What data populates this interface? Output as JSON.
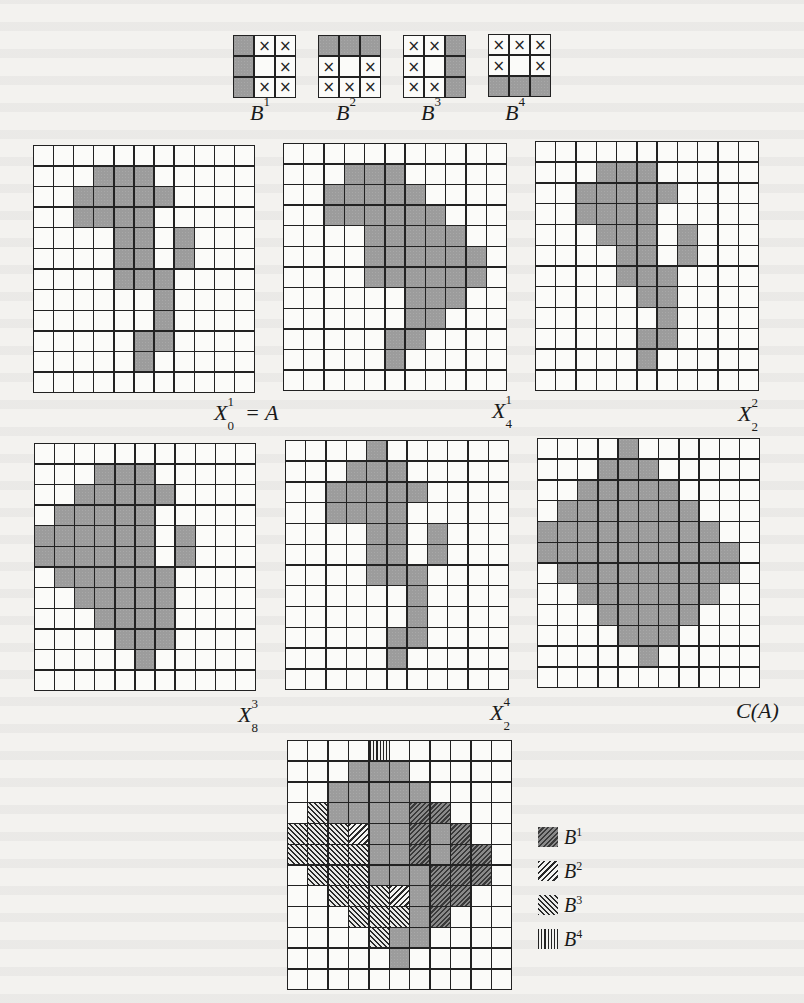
{
  "figure": {
    "grid_size": {
      "rows": 12,
      "cols": 11
    },
    "colors": {
      "shaded": "#9c9c9c",
      "line": "#222222",
      "background": "#f3f2ef"
    },
    "templates": [
      {
        "id": "B1",
        "base": "B",
        "sup": "1",
        "cells": [
          [
            "s",
            "x",
            "x"
          ],
          [
            "s",
            "o",
            "x"
          ],
          [
            "s",
            "x",
            "x"
          ]
        ]
      },
      {
        "id": "B2",
        "base": "B",
        "sup": "2",
        "cells": [
          [
            "s",
            "s",
            "s"
          ],
          [
            "x",
            "o",
            "x"
          ],
          [
            "x",
            "x",
            "x"
          ]
        ]
      },
      {
        "id": "B3",
        "base": "B",
        "sup": "3",
        "cells": [
          [
            "x",
            "x",
            "s"
          ],
          [
            "x",
            "o",
            "s"
          ],
          [
            "x",
            "x",
            "s"
          ]
        ]
      },
      {
        "id": "B4",
        "base": "B",
        "sup": "4",
        "cells": [
          [
            "x",
            "x",
            "x"
          ],
          [
            "x",
            "o",
            "x"
          ],
          [
            "s",
            "s",
            "s"
          ]
        ]
      }
    ],
    "panels": [
      {
        "id": "X01",
        "label_base": "X",
        "label_sup": "1",
        "label_sub": "0",
        "label_suffix": " = A",
        "shaded": {
          "1": [
            3,
            4,
            5
          ],
          "2": [
            2,
            3,
            4,
            5,
            6
          ],
          "3": [
            2,
            3,
            4,
            5
          ],
          "4": [
            4,
            5,
            7
          ],
          "5": [
            4,
            5,
            7
          ],
          "6": [
            4,
            5,
            6
          ],
          "7": [
            6
          ],
          "8": [
            6
          ],
          "9": [
            5,
            6
          ],
          "10": [
            5
          ]
        }
      },
      {
        "id": "X41",
        "label_base": "X",
        "label_sup": "1",
        "label_sub": "4",
        "label_suffix": "",
        "shaded": {
          "1": [
            3,
            4,
            5
          ],
          "2": [
            2,
            3,
            4,
            5,
            6
          ],
          "3": [
            2,
            3,
            4,
            5,
            6,
            7
          ],
          "4": [
            4,
            5,
            6,
            7,
            8
          ],
          "5": [
            4,
            5,
            6,
            7,
            8,
            9
          ],
          "6": [
            4,
            5,
            6,
            7,
            8,
            9
          ],
          "7": [
            6,
            7,
            8
          ],
          "8": [
            6,
            7
          ],
          "9": [
            5,
            6
          ],
          "10": [
            5
          ]
        }
      },
      {
        "id": "X22",
        "label_base": "X",
        "label_sup": "2",
        "label_sub": "2",
        "label_suffix": "",
        "shaded": {
          "1": [
            3,
            4,
            5
          ],
          "2": [
            2,
            3,
            4,
            5,
            6
          ],
          "3": [
            2,
            3,
            4,
            5
          ],
          "4": [
            3,
            4,
            5,
            7
          ],
          "5": [
            4,
            5,
            7
          ],
          "6": [
            4,
            5,
            6
          ],
          "7": [
            5,
            6
          ],
          "8": [
            6
          ],
          "9": [
            5,
            6
          ],
          "10": [
            5
          ]
        }
      },
      {
        "id": "X83",
        "label_base": "X",
        "label_sup": "3",
        "label_sub": "8",
        "label_suffix": "",
        "shaded": {
          "1": [
            3,
            4,
            5
          ],
          "2": [
            2,
            3,
            4,
            5,
            6
          ],
          "3": [
            1,
            2,
            3,
            4,
            5
          ],
          "4": [
            0,
            1,
            2,
            3,
            4,
            5,
            7
          ],
          "5": [
            0,
            1,
            2,
            3,
            4,
            5,
            7
          ],
          "6": [
            1,
            2,
            3,
            4,
            5,
            6
          ],
          "7": [
            2,
            3,
            4,
            5,
            6
          ],
          "8": [
            3,
            4,
            5,
            6
          ],
          "9": [
            4,
            5,
            6
          ],
          "10": [
            5
          ]
        }
      },
      {
        "id": "X24",
        "label_base": "X",
        "label_sup": "4",
        "label_sub": "2",
        "label_suffix": "",
        "shaded": {
          "0": [
            4
          ],
          "1": [
            3,
            4,
            5
          ],
          "2": [
            2,
            3,
            4,
            5,
            6
          ],
          "3": [
            2,
            3,
            4,
            5
          ],
          "4": [
            4,
            5,
            7
          ],
          "5": [
            4,
            5,
            7
          ],
          "6": [
            4,
            5,
            6
          ],
          "7": [
            6
          ],
          "8": [
            6
          ],
          "9": [
            5,
            6
          ],
          "10": [
            5
          ]
        }
      },
      {
        "id": "CA",
        "label_base": "C(A)",
        "label_sup": "",
        "label_sub": "",
        "label_suffix": "",
        "shaded": {
          "0": [
            4
          ],
          "1": [
            3,
            4,
            5
          ],
          "2": [
            2,
            3,
            4,
            5,
            6
          ],
          "3": [
            1,
            2,
            3,
            4,
            5,
            6,
            7
          ],
          "4": [
            0,
            1,
            2,
            3,
            4,
            5,
            6,
            7,
            8
          ],
          "5": [
            0,
            1,
            2,
            3,
            4,
            5,
            6,
            7,
            8,
            9
          ],
          "6": [
            1,
            2,
            3,
            4,
            5,
            6,
            7,
            8,
            9
          ],
          "7": [
            2,
            3,
            4,
            5,
            6,
            7,
            8
          ],
          "8": [
            3,
            4,
            5,
            6,
            7
          ],
          "9": [
            4,
            5,
            6
          ],
          "10": [
            5
          ]
        }
      }
    ],
    "combined": {
      "cells": {
        "0": {
          "4": "b4"
        },
        "1": {
          "3": "s",
          "4": "s",
          "5": "s"
        },
        "2": {
          "2": "s",
          "3": "s",
          "4": "s",
          "5": "s",
          "6": "s"
        },
        "3": {
          "1": "b3",
          "2": "s",
          "3": "s",
          "4": "s",
          "5": "s",
          "6": "b1",
          "7": "b1"
        },
        "4": {
          "0": "b3",
          "1": "b3",
          "2": "b3",
          "3": "b2",
          "4": "s",
          "5": "s",
          "6": "b1",
          "7": "s",
          "8": "b1"
        },
        "5": {
          "0": "b3",
          "1": "b3",
          "2": "b3",
          "3": "b3",
          "4": "s",
          "5": "s",
          "6": "b1",
          "7": "s",
          "8": "b1",
          "9": "b1"
        },
        "6": {
          "1": "b3",
          "2": "b3",
          "3": "b3",
          "4": "s",
          "5": "s",
          "6": "s",
          "7": "b1",
          "8": "b1",
          "9": "b1"
        },
        "7": {
          "2": "b3",
          "3": "b3",
          "4": "b3",
          "5": "b2",
          "6": "s",
          "7": "b1",
          "8": "b1"
        },
        "8": {
          "3": "b3",
          "4": "b3",
          "5": "b3",
          "6": "s",
          "7": "b1"
        },
        "9": {
          "4": "b3",
          "5": "s",
          "6": "s"
        },
        "10": {
          "5": "s"
        }
      },
      "legend": [
        {
          "pattern": "b1",
          "base": "B",
          "sup": "1"
        },
        {
          "pattern": "b2",
          "base": "B",
          "sup": "2"
        },
        {
          "pattern": "b3",
          "base": "B",
          "sup": "3"
        },
        {
          "pattern": "b4",
          "base": "B",
          "sup": "4"
        }
      ]
    }
  }
}
